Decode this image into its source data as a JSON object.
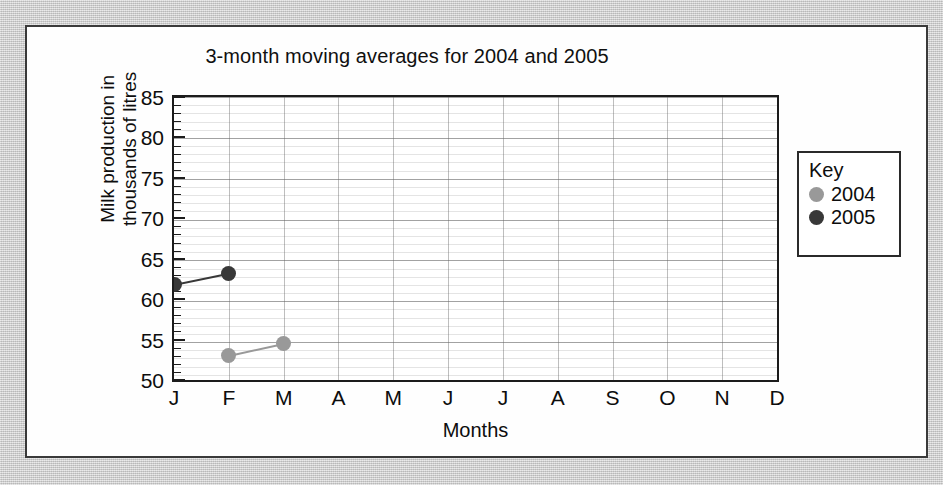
{
  "panel": {
    "background_color": "#fefefe",
    "border_color": "#3a3a3a"
  },
  "chart_data": {
    "type": "line",
    "title": "3-month moving averages for 2004 and 2005",
    "xlabel": "Months",
    "ylabel": "Milk production in thousands of litres",
    "ylabel_line1": "Milk production in",
    "ylabel_line2": "thousands of litres",
    "categories": [
      "J",
      "F",
      "M",
      "A",
      "M",
      "J",
      "J",
      "A",
      "S",
      "O",
      "N",
      "D"
    ],
    "xlim": [
      0,
      11
    ],
    "ylim": [
      50,
      85
    ],
    "ytick_labels": [
      "85",
      "80",
      "75",
      "70",
      "65",
      "60",
      "55",
      "50"
    ],
    "ytick_values": [
      85,
      80,
      75,
      70,
      65,
      60,
      55,
      50
    ],
    "ytick_step_major": 5,
    "ytick_step_minor": 1,
    "grid": true,
    "legend_position": "right",
    "legend_title": "Key",
    "series": [
      {
        "name": "2004",
        "color": "#999999",
        "points": [
          {
            "x": "F",
            "x_index": 1,
            "y": 53.0
          },
          {
            "x": "M",
            "x_index": 2,
            "y": 54.5
          }
        ]
      },
      {
        "name": "2005",
        "color": "#383838",
        "points": [
          {
            "x": "J",
            "x_index": 0,
            "y": 61.8
          },
          {
            "x": "F",
            "x_index": 1,
            "y": 63.2
          }
        ]
      }
    ]
  }
}
